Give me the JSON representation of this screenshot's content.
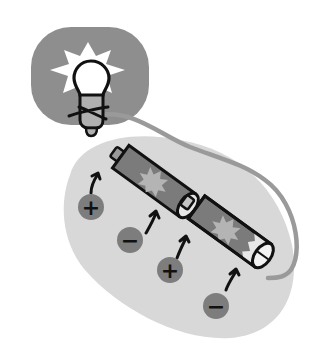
{
  "diagram": {
    "colors": {
      "background": "#ffffff",
      "bulb_glow_panel": "#8e8e8e",
      "battery_area": "#d8d8d8",
      "battery_body": "#7b7b7b",
      "battery_star": "#b4b4b4",
      "wire": "#9a9a9a",
      "terminal_badge": "#7d7d7d",
      "outline": "#111111",
      "bulb": "#ffffff",
      "bulb_base": "#b0b0b0"
    },
    "terminals": [
      {
        "label": "+",
        "meaning": "positive"
      },
      {
        "label": "−",
        "meaning": "negative"
      },
      {
        "label": "+",
        "meaning": "positive"
      },
      {
        "label": "−",
        "meaning": "negative"
      }
    ],
    "components": [
      "light-bulb",
      "battery-1",
      "battery-2",
      "wire"
    ]
  }
}
